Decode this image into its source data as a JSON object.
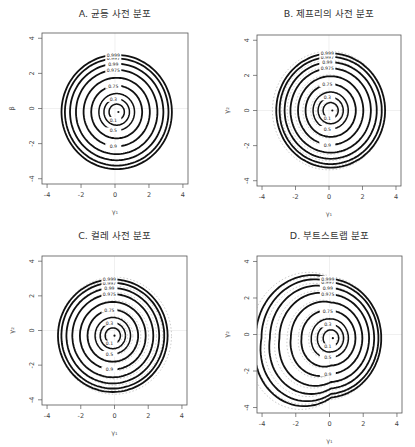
{
  "figure": {
    "panels": [
      {
        "id": "A",
        "title": "A. 균등 사전 분포"
      },
      {
        "id": "B",
        "title": "B. 제프리의 사전 분포"
      },
      {
        "id": "C",
        "title": "C. 컬레 사전 분포"
      },
      {
        "id": "D",
        "title": "D. 부트스트랩 분포"
      }
    ]
  },
  "chart_data": [
    {
      "type": "contour",
      "title": "A. 균등 사전 분포",
      "xlabel": "γ₁",
      "ylabel": "β",
      "xlim": [
        -4.3,
        4.3
      ],
      "ylim": [
        -4.3,
        4.3
      ],
      "xticks": [
        -4,
        -2,
        0,
        2,
        4
      ],
      "yticks": [
        -4,
        -2,
        0,
        2,
        4
      ],
      "center": [
        0.1,
        -0.2
      ],
      "levels": [
        0.1,
        0.3,
        0.5,
        0.75,
        0.9,
        0.975,
        0.99,
        0.997,
        0.999
      ],
      "reference_contours": false
    },
    {
      "type": "contour",
      "title": "B. 제프리의 사전 분포",
      "xlabel": "γ₁",
      "ylabel": "γ₂",
      "xlim": [
        -4.3,
        4.3
      ],
      "ylim": [
        -4.3,
        4.3
      ],
      "xticks": [
        -4,
        -2,
        0,
        2,
        4
      ],
      "yticks": [
        -4,
        -2,
        0,
        2,
        4
      ],
      "center": [
        0.1,
        0.0
      ],
      "levels": [
        0.1,
        0.3,
        0.5,
        0.75,
        0.9,
        0.975,
        0.99,
        0.997,
        0.999
      ],
      "reference_contours": true
    },
    {
      "type": "contour",
      "title": "C. 컬레 사전 분포",
      "xlabel": "γ₁",
      "ylabel": "γ₂",
      "xlim": [
        -4.3,
        4.3
      ],
      "ylim": [
        -4.3,
        4.3
      ],
      "xticks": [
        -4,
        -2,
        0,
        2,
        4
      ],
      "yticks": [
        -4,
        -2,
        0,
        2,
        4
      ],
      "center": [
        -0.1,
        -0.3
      ],
      "levels": [
        0.1,
        0.3,
        0.5,
        0.75,
        0.9,
        0.975,
        0.99,
        0.997,
        0.999
      ],
      "reference_contours": true
    },
    {
      "type": "contour",
      "title": "D. 부트스트랩 분포",
      "xlabel": "γ₁",
      "ylabel": "γ₂",
      "xlim": [
        -4.3,
        4.3
      ],
      "ylim": [
        -4.3,
        4.3
      ],
      "xticks": [
        -4,
        -2,
        0,
        2,
        4
      ],
      "yticks": [
        -4,
        -2,
        0,
        2,
        4
      ],
      "center": [
        0.1,
        -0.2
      ],
      "levels": [
        0.1,
        0.3,
        0.5,
        0.75,
        0.9,
        0.975,
        0.99,
        0.997,
        0.999
      ],
      "reference_contours": true,
      "note": "contours skewed, extending to lower-left"
    }
  ]
}
